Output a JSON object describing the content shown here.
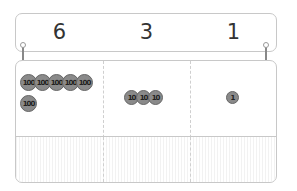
{
  "header": {
    "digits": [
      "6",
      "3",
      "1"
    ]
  },
  "table": {
    "columns": [
      {
        "place": "hundreds",
        "coin_label": "100",
        "coins": [
          "100",
          "100",
          "100",
          "100",
          "100",
          "100"
        ]
      },
      {
        "place": "tens",
        "coin_label": "10",
        "coins": [
          "10",
          "10",
          "10"
        ]
      },
      {
        "place": "ones",
        "coin_label": "1",
        "coins": [
          "1"
        ]
      }
    ]
  },
  "colors": {
    "border": "#c8c8c8",
    "coin": "#8a8a8a",
    "coin_edge": "#666666",
    "text": "#333333"
  }
}
